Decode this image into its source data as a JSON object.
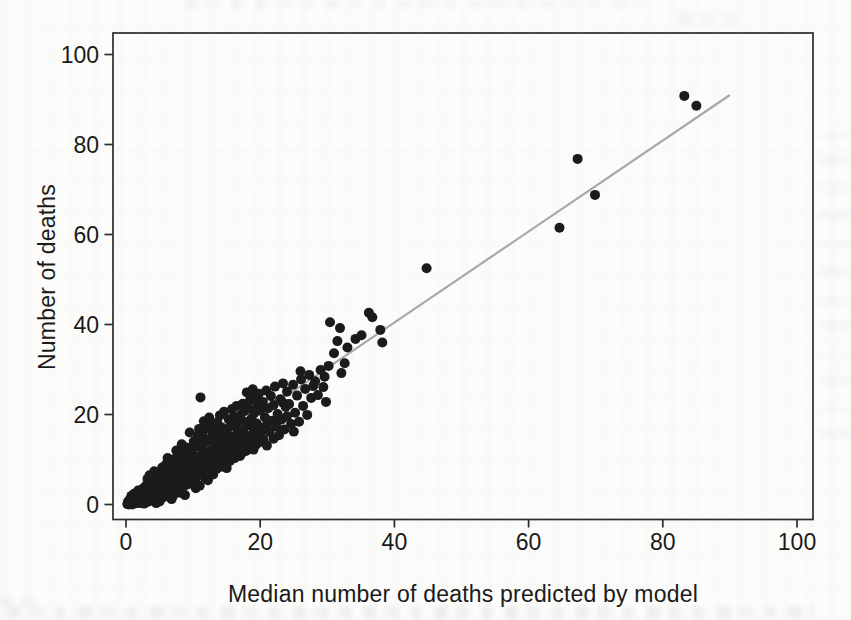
{
  "figure": {
    "xlabel": "Median number of deaths predicted by model",
    "ylabel": "Number of deaths"
  },
  "chart_data": {
    "type": "scatter",
    "title": "",
    "xlabel": "Median number of deaths predicted by model",
    "ylabel": "Number of deaths",
    "xlim": [
      -2,
      102
    ],
    "ylim": [
      -3,
      105
    ],
    "x_ticks": [
      0,
      20,
      40,
      60,
      80,
      100
    ],
    "y_ticks": [
      0,
      20,
      40,
      60,
      80,
      100
    ],
    "grid": false,
    "legend": "none",
    "marker_color": "#1b1b1b",
    "marker_radius_px": 5,
    "frame_color": "#2b2b2b",
    "reference_line": {
      "x1": 0,
      "y1": 0,
      "x2": 90,
      "y2": 91,
      "color": "#a8a8a8"
    },
    "points": [
      [
        0.2,
        0.1
      ],
      [
        0.3,
        0.6
      ],
      [
        0.4,
        0
      ],
      [
        0.5,
        1
      ],
      [
        0.6,
        0.3
      ],
      [
        0.7,
        1.4
      ],
      [
        0.8,
        0.6
      ],
      [
        0.9,
        0
      ],
      [
        1,
        1.8
      ],
      [
        1.1,
        0.9
      ],
      [
        1.2,
        0.2
      ],
      [
        1.3,
        1.5
      ],
      [
        1.4,
        0.7
      ],
      [
        1.5,
        2.2
      ],
      [
        0.5,
        0.2
      ],
      [
        0.8,
        1.9
      ],
      [
        1.2,
        2.4
      ],
      [
        1.5,
        0.4
      ],
      [
        0.9,
        1.2
      ],
      [
        1.4,
        1.9
      ],
      [
        1.6,
        0.5
      ],
      [
        1.7,
        1.9
      ],
      [
        1.8,
        0.9
      ],
      [
        1.9,
        2.8
      ],
      [
        2,
        0.3
      ],
      [
        2,
        1.5
      ],
      [
        2.1,
        2.3
      ],
      [
        2.2,
        0.8
      ],
      [
        2.3,
        3.2
      ],
      [
        2.4,
        1.2
      ],
      [
        2.5,
        2
      ],
      [
        2.5,
        0.4
      ],
      [
        2.6,
        3.6
      ],
      [
        2.7,
        1.6
      ],
      [
        2.8,
        2.6
      ],
      [
        2.9,
        0.9
      ],
      [
        3,
        2.1
      ],
      [
        3,
        4.2
      ],
      [
        2.2,
        1.8
      ],
      [
        2.7,
        0.2
      ],
      [
        1.8,
        3.1
      ],
      [
        2.9,
        3.4
      ],
      [
        3.1,
        1.2
      ],
      [
        3.2,
        2.9
      ],
      [
        3.3,
        0.6
      ],
      [
        3.4,
        4.1
      ],
      [
        3.5,
        2.2
      ],
      [
        3.6,
        3.3
      ],
      [
        3.7,
        1.5
      ],
      [
        3.8,
        5
      ],
      [
        3.9,
        2.6
      ],
      [
        4,
        0.9
      ],
      [
        4,
        3.8
      ],
      [
        4.1,
        2
      ],
      [
        4.2,
        4.6
      ],
      [
        4.3,
        1.4
      ],
      [
        4.4,
        3.1
      ],
      [
        4.5,
        5.6
      ],
      [
        4.6,
        2.4
      ],
      [
        4.7,
        4
      ],
      [
        4.8,
        1.8
      ],
      [
        4.9,
        6.2
      ],
      [
        5,
        3.5
      ],
      [
        5,
        0.7
      ],
      [
        3.5,
        6.5
      ],
      [
        4.2,
        7.4
      ],
      [
        4.8,
        5.1
      ],
      [
        3.9,
        4.4
      ],
      [
        4.5,
        0.3
      ],
      [
        3.2,
        5.7
      ],
      [
        5.1,
        4.3
      ],
      [
        5.2,
        2.1
      ],
      [
        5.3,
        6
      ],
      [
        5.4,
        3.4
      ],
      [
        5.5,
        5.2
      ],
      [
        5.6,
        1.6
      ],
      [
        5.7,
        7.1
      ],
      [
        5.8,
        4
      ],
      [
        5.9,
        2.8
      ],
      [
        6,
        5.8
      ],
      [
        6,
        9
      ],
      [
        6.1,
        3.1
      ],
      [
        6.2,
        6.6
      ],
      [
        6.3,
        4.8
      ],
      [
        6.4,
        2.2
      ],
      [
        6.5,
        7.8
      ],
      [
        6.6,
        5.4
      ],
      [
        6.7,
        3.7
      ],
      [
        6.8,
        8.6
      ],
      [
        6.9,
        6.1
      ],
      [
        7,
        4.4
      ],
      [
        7,
        1.9
      ],
      [
        5.4,
        8.2
      ],
      [
        6.2,
        10.3
      ],
      [
        6.8,
        1.2
      ],
      [
        5.8,
        6.9
      ],
      [
        6.5,
        2.9
      ],
      [
        7,
        9.6
      ],
      [
        7.1,
        6.8
      ],
      [
        7.2,
        4.1
      ],
      [
        7.3,
        8.3
      ],
      [
        7.4,
        5.5
      ],
      [
        7.5,
        3.2
      ],
      [
        7.6,
        9.4
      ],
      [
        7.7,
        6.2
      ],
      [
        7.8,
        4.7
      ],
      [
        7.9,
        10.8
      ],
      [
        8,
        7.4
      ],
      [
        8,
        2.6
      ],
      [
        8.1,
        5.9
      ],
      [
        8.2,
        8.9
      ],
      [
        8.3,
        3.9
      ],
      [
        8.4,
        6.6
      ],
      [
        8.5,
        11.6
      ],
      [
        8.6,
        5.1
      ],
      [
        8.7,
        9.8
      ],
      [
        8.8,
        7
      ],
      [
        8.9,
        4.3
      ],
      [
        9,
        8.1
      ],
      [
        9,
        12.7
      ],
      [
        7.5,
        12
      ],
      [
        8.3,
        13.4
      ],
      [
        8.8,
        2.1
      ],
      [
        7.2,
        10.1
      ],
      [
        9.1,
        7.7
      ],
      [
        9.2,
        5.3
      ],
      [
        9.3,
        10.4
      ],
      [
        9.4,
        8.6
      ],
      [
        9.5,
        4.6
      ],
      [
        9.6,
        12.2
      ],
      [
        9.7,
        6.9
      ],
      [
        9.8,
        9.3
      ],
      [
        9.9,
        5.9
      ],
      [
        10,
        11.1
      ],
      [
        10,
        7.2
      ],
      [
        10.1,
        14
      ],
      [
        10.2,
        8.4
      ],
      [
        10.3,
        5
      ],
      [
        10.4,
        12.9
      ],
      [
        10.5,
        9.9
      ],
      [
        10.6,
        6.4
      ],
      [
        10.7,
        15.3
      ],
      [
        10.8,
        10.7
      ],
      [
        10.9,
        7.9
      ],
      [
        11,
        13.5
      ],
      [
        11,
        4.2
      ],
      [
        9.5,
        16
      ],
      [
        10.4,
        3.6
      ],
      [
        10.9,
        16.8
      ],
      [
        11.1,
        23.8
      ],
      [
        11.2,
        9.1
      ],
      [
        11.3,
        12.4
      ],
      [
        11.4,
        7.3
      ],
      [
        11.5,
        15.1
      ],
      [
        11.6,
        10.2
      ],
      [
        11.7,
        6.1
      ],
      [
        11.8,
        13.8
      ],
      [
        11.9,
        8.7
      ],
      [
        12,
        11.6
      ],
      [
        12,
        16.9
      ],
      [
        12.1,
        9.6
      ],
      [
        12.2,
        5.4
      ],
      [
        12.3,
        14.4
      ],
      [
        12.4,
        10.9
      ],
      [
        12.5,
        7.8
      ],
      [
        12.6,
        17.7
      ],
      [
        12.7,
        12.1
      ],
      [
        12.8,
        8.2
      ],
      [
        12.9,
        15.8
      ],
      [
        13,
        11.2
      ],
      [
        13,
        6.7
      ],
      [
        11.6,
        18.5
      ],
      [
        12.4,
        19.3
      ],
      [
        13.1,
        13.9
      ],
      [
        13.2,
        9.4
      ],
      [
        13.3,
        16.6
      ],
      [
        13.4,
        11.7
      ],
      [
        13.5,
        7.9
      ],
      [
        13.6,
        18.2
      ],
      [
        13.7,
        12.8
      ],
      [
        13.8,
        9
      ],
      [
        13.9,
        15.4
      ],
      [
        14,
        11
      ],
      [
        14,
        19.8
      ],
      [
        14.1,
        13.3
      ],
      [
        14.2,
        8.4
      ],
      [
        14.3,
        17.1
      ],
      [
        14.4,
        12.3
      ],
      [
        14.5,
        9.8
      ],
      [
        14.6,
        20.6
      ],
      [
        14.7,
        14.7
      ],
      [
        14.8,
        10.5
      ],
      [
        14.9,
        16.2
      ],
      [
        15,
        12.6
      ],
      [
        15,
        8.1
      ],
      [
        15.1,
        15.7
      ],
      [
        15.2,
        11.4
      ],
      [
        15.3,
        18.9
      ],
      [
        15.4,
        13.6
      ],
      [
        15.5,
        9.7
      ],
      [
        15.6,
        17.4
      ],
      [
        15.7,
        12.9
      ],
      [
        15.8,
        21.2
      ],
      [
        15.9,
        15
      ],
      [
        16,
        11.1
      ],
      [
        16,
        19.5
      ],
      [
        16.1,
        14.2
      ],
      [
        16.2,
        10.3
      ],
      [
        16.3,
        17.9
      ],
      [
        16.4,
        13.1
      ],
      [
        16.5,
        21.9
      ],
      [
        16.6,
        15.9
      ],
      [
        16.7,
        12
      ],
      [
        16.8,
        18.7
      ],
      [
        16.9,
        14.5
      ],
      [
        17,
        10.8
      ],
      [
        17,
        16.5
      ],
      [
        17.1,
        19.9
      ],
      [
        17.2,
        14.1
      ],
      [
        17.3,
        11.5
      ],
      [
        17.4,
        22.4
      ],
      [
        17.5,
        16.8
      ],
      [
        17.6,
        13
      ],
      [
        17.7,
        20.8
      ],
      [
        17.8,
        15.5
      ],
      [
        17.9,
        11.9
      ],
      [
        18,
        18.3
      ],
      [
        18,
        24.9
      ],
      [
        18.1,
        14.8
      ],
      [
        18.2,
        21.6
      ],
      [
        18.3,
        12.4
      ],
      [
        18.4,
        17.6
      ],
      [
        18.5,
        23.2
      ],
      [
        18.6,
        15.2
      ],
      [
        18.7,
        19.1
      ],
      [
        18.8,
        13.7
      ],
      [
        18.9,
        25.6
      ],
      [
        19,
        16.9
      ],
      [
        19,
        12.2
      ],
      [
        19.1,
        20.3
      ],
      [
        19.2,
        15.8
      ],
      [
        19.3,
        23.9
      ],
      [
        19.4,
        13.3
      ],
      [
        19.5,
        18
      ],
      [
        19.6,
        21.9
      ],
      [
        19.7,
        14.9
      ],
      [
        19.8,
        24.6
      ],
      [
        19.9,
        17.2
      ],
      [
        20,
        13.9
      ],
      [
        20,
        20.9
      ],
      [
        20.2,
        16.3
      ],
      [
        20.4,
        22.8
      ],
      [
        20.5,
        14.4
      ],
      [
        20.7,
        19.4
      ],
      [
        20.9,
        25.3
      ],
      [
        21,
        17.7
      ],
      [
        21,
        13.1
      ],
      [
        21.2,
        21.4
      ],
      [
        21.4,
        16.1
      ],
      [
        21.6,
        24.1
      ],
      [
        21.8,
        18.6
      ],
      [
        22,
        14.6
      ],
      [
        22,
        22.1
      ],
      [
        22.2,
        26.2
      ],
      [
        22.4,
        17.3
      ],
      [
        22.6,
        20.1
      ],
      [
        22.8,
        15.4
      ],
      [
        23,
        23.4
      ],
      [
        23.2,
        18.9
      ],
      [
        23.4,
        26.9
      ],
      [
        23.6,
        16.7
      ],
      [
        23.8,
        21.7
      ],
      [
        24,
        19.6
      ],
      [
        24,
        25.1
      ],
      [
        23.4,
        22.6
      ],
      [
        24.3,
        22.3
      ],
      [
        24.6,
        17.9
      ],
      [
        24.9,
        26.6
      ],
      [
        25.2,
        20.4
      ],
      [
        25.5,
        24.2
      ],
      [
        25.8,
        18.4
      ],
      [
        26.1,
        27.8
      ],
      [
        26.4,
        21.9
      ],
      [
        26.7,
        25.7
      ],
      [
        27,
        19.9
      ],
      [
        27.3,
        28.8
      ],
      [
        27.6,
        23.7
      ],
      [
        27.9,
        26.3
      ],
      [
        25,
        16.2
      ],
      [
        26,
        29.6
      ],
      [
        28.2,
        27.4
      ],
      [
        28.6,
        24.3
      ],
      [
        29,
        29.9
      ],
      [
        29.4,
        26.1
      ],
      [
        29.6,
        28.4
      ],
      [
        29.8,
        22.8
      ],
      [
        30.2,
        30.8
      ],
      [
        30.4,
        40.5
      ],
      [
        31,
        33.6
      ],
      [
        31.5,
        36.3
      ],
      [
        31.9,
        39.2
      ],
      [
        32.1,
        29.2
      ],
      [
        32.6,
        31.4
      ],
      [
        33,
        34.9
      ],
      [
        34.2,
        36.8
      ],
      [
        35.1,
        37.6
      ],
      [
        36.2,
        42.6
      ],
      [
        36.7,
        41.6
      ],
      [
        37.9,
        38.8
      ],
      [
        38.2,
        36
      ],
      [
        44.8,
        52.5
      ],
      [
        64.6,
        61.5
      ],
      [
        69.9,
        68.8
      ],
      [
        67.3,
        76.8
      ],
      [
        83.2,
        90.8
      ],
      [
        85,
        88.6
      ]
    ]
  }
}
